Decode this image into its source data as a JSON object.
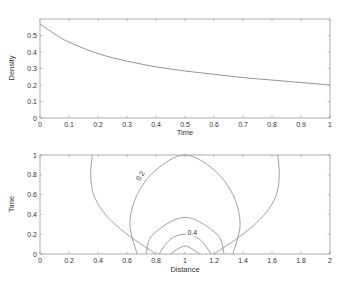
{
  "chart_data": [
    {
      "type": "line",
      "title": "",
      "xlabel": "Time",
      "ylabel": "Density",
      "xlim": [
        0,
        1
      ],
      "ylim": [
        0,
        0.6
      ],
      "grid": false,
      "xticks": [
        "0",
        "0.1",
        "0.2",
        "0.3",
        "0.4",
        "0.5",
        "0.6",
        "0.7",
        "0.8",
        "0.9",
        "1"
      ],
      "yticks": [
        "0",
        "0.1",
        "0.2",
        "0.3",
        "0.4",
        "0.5"
      ],
      "series": [
        {
          "name": "density",
          "x": [
            0,
            0.05,
            0.1,
            0.2,
            0.3,
            0.4,
            0.5,
            0.6,
            0.7,
            0.8,
            0.9,
            1.0
          ],
          "values": [
            0.57,
            0.51,
            0.46,
            0.39,
            0.345,
            0.31,
            0.285,
            0.265,
            0.245,
            0.23,
            0.215,
            0.2
          ]
        }
      ]
    },
    {
      "type": "contour",
      "title": "",
      "xlabel": "Distance",
      "ylabel": "Time",
      "xlim": [
        0,
        2
      ],
      "ylim": [
        0,
        1
      ],
      "grid": false,
      "xticks": [
        "0",
        "0.2",
        "0.4",
        "0.6",
        "0.8",
        "1",
        "1.2",
        "1.4",
        "1.6",
        "1.8",
        "2"
      ],
      "yticks": [
        "0",
        "0.2",
        "0.4",
        "0.6",
        "0.8",
        "1"
      ],
      "contour_labels": [
        {
          "text": "0.2",
          "x": 0.7,
          "y": 0.78
        },
        {
          "text": "0.4",
          "x": 1.05,
          "y": 0.2
        }
      ],
      "contours": [
        {
          "level": 0.1,
          "side": "left",
          "points": [
            [
              0.36,
              1
            ],
            [
              0.35,
              0.8
            ],
            [
              0.37,
              0.6
            ],
            [
              0.45,
              0.4
            ],
            [
              0.6,
              0.2
            ],
            [
              0.8,
              0
            ]
          ]
        },
        {
          "level": 0.1,
          "side": "right",
          "points": [
            [
              1.64,
              1
            ],
            [
              1.65,
              0.8
            ],
            [
              1.63,
              0.6
            ],
            [
              1.55,
              0.4
            ],
            [
              1.4,
              0.2
            ],
            [
              1.2,
              0
            ]
          ]
        },
        {
          "level": 0.2,
          "points": [
            [
              0.67,
              0
            ],
            [
              0.62,
              0.3
            ],
            [
              0.67,
              0.6
            ],
            [
              0.8,
              0.85
            ],
            [
              1,
              1
            ],
            [
              1.2,
              0.85
            ],
            [
              1.33,
              0.6
            ],
            [
              1.38,
              0.3
            ],
            [
              1.33,
              0
            ]
          ]
        },
        {
          "level": 0.3,
          "points": [
            [
              0.73,
              0
            ],
            [
              0.78,
              0.2
            ],
            [
              1,
              0.37
            ],
            [
              1.22,
              0.2
            ],
            [
              1.27,
              0
            ]
          ]
        },
        {
          "level": 0.4,
          "points": [
            [
              0.82,
              0
            ],
            [
              0.9,
              0.15
            ],
            [
              1,
              0.2
            ],
            [
              1.1,
              0.15
            ],
            [
              1.18,
              0
            ]
          ]
        },
        {
          "level": 0.5,
          "points": [
            [
              0.9,
              0
            ],
            [
              1,
              0.08
            ],
            [
              1.1,
              0
            ]
          ]
        }
      ]
    }
  ],
  "labels": {
    "top_xlabel": "Time",
    "top_ylabel": "Density",
    "bottom_xlabel": "Distance",
    "bottom_ylabel": "Time",
    "contour_label_1": "0.2",
    "contour_label_2": "0.4"
  },
  "colors": {
    "line": "#888888",
    "axis": "#999999",
    "text": "#333333"
  }
}
